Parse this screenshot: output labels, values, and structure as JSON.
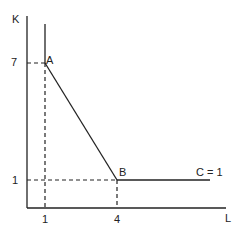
{
  "diagram": {
    "axes": {
      "y_label": "K",
      "x_label": "L"
    },
    "ticks": {
      "y": [
        {
          "label": "7",
          "value": 7
        },
        {
          "label": "1",
          "value": 1
        }
      ],
      "x": [
        {
          "label": "1",
          "value": 1
        },
        {
          "label": "4",
          "value": 4
        }
      ]
    },
    "points": [
      {
        "label": "A",
        "L": 1,
        "K": 7
      },
      {
        "label": "B",
        "L": 4,
        "K": 1
      }
    ],
    "curve_label": "C = 1",
    "colors": {
      "line": "#222222",
      "background": "#ffffff"
    }
  }
}
